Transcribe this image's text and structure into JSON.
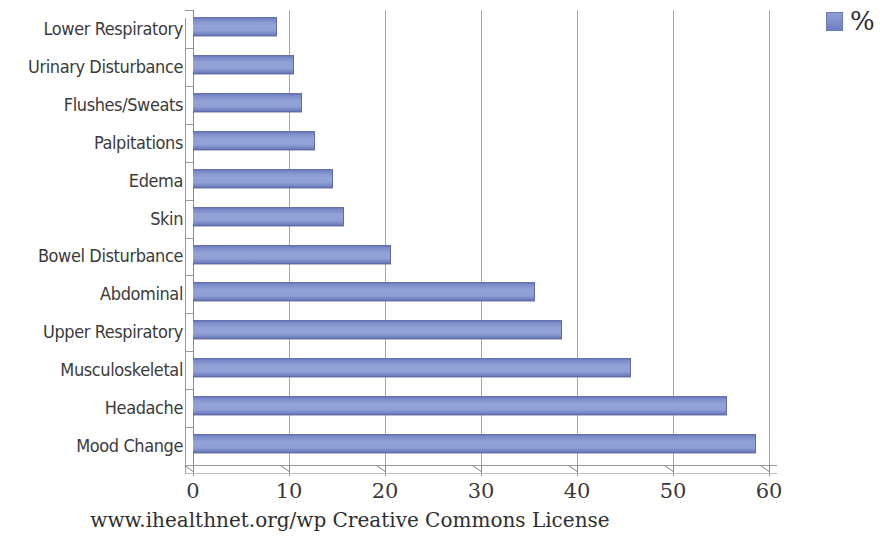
{
  "chart_data": {
    "type": "bar",
    "orientation": "horizontal",
    "title": "",
    "xlabel": "",
    "ylabel": "",
    "xlim": [
      0,
      60
    ],
    "xticks": [
      0,
      10,
      20,
      30,
      40,
      50,
      60
    ],
    "grid": true,
    "legend_position": "top-right",
    "series": [
      {
        "name": "%",
        "color": "#7b8cc9",
        "values": [
          58.5,
          55.5,
          45.5,
          38.3,
          35.5,
          20.5,
          15.6,
          14.5,
          12.6,
          11.3,
          10.4,
          8.6
        ]
      }
    ],
    "categories": [
      "Mood Change",
      "Headache",
      "Musculoskeletal",
      "Upper Respiratory",
      "Abdominal",
      "Bowel Disturbance",
      "Skin",
      "Edema",
      "Palpitations",
      "Flushes/Sweats",
      "Urinary Disturbance",
      "Lower Respiratory"
    ],
    "annotations": [
      "www.ihealthnet.org/wp Creative Commons License"
    ]
  },
  "legend": {
    "label": "%",
    "swatch_color": "#7b8cc9"
  },
  "axis": {
    "x_tick_labels": [
      "0",
      "10",
      "20",
      "30",
      "40",
      "50",
      "60"
    ]
  },
  "footer": {
    "text": "www.ihealthnet.org/wp Creative Commons License"
  }
}
